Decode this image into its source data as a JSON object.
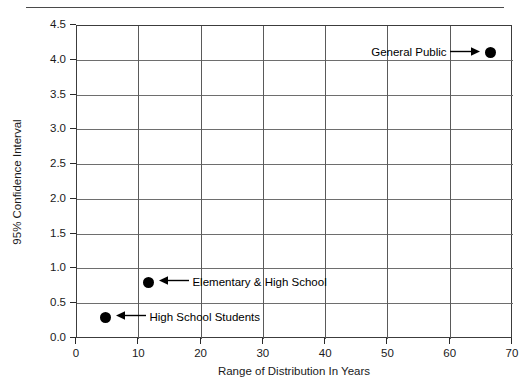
{
  "page": {
    "top_rule_visible": true,
    "top_cropped_text": ""
  },
  "chart_data": {
    "type": "scatter",
    "title": "",
    "xlabel": "Range of Distribution In Years",
    "ylabel": "95% Confidence Interval",
    "xlim": [
      0,
      70
    ],
    "ylim": [
      0.0,
      4.5
    ],
    "xticks": [
      "0",
      "10",
      "20",
      "30",
      "40",
      "50",
      "60",
      "70"
    ],
    "xtick_values": [
      0,
      10,
      20,
      30,
      40,
      50,
      60,
      70
    ],
    "yticks": [
      "0.0",
      "0.5",
      "1.0",
      "1.5",
      "2.0",
      "2.5",
      "3.0",
      "3.5",
      "4.0",
      "4.5"
    ],
    "ytick_values": [
      0.0,
      0.5,
      1.0,
      1.5,
      2.0,
      2.5,
      3.0,
      3.5,
      4.0,
      4.5
    ],
    "grid": true,
    "grid_axes": "both",
    "legend": "none",
    "marker_color": "#000000",
    "marker_shape": "circle",
    "points": [
      {
        "label": "General Public",
        "x": 66.6,
        "y": 4.1,
        "annotation_side": "left",
        "arrow": "→"
      },
      {
        "label": "Elementary & High School",
        "x": 11.6,
        "y": 0.8,
        "annotation_side": "right",
        "arrow": "←"
      },
      {
        "label": "High School Students",
        "x": 4.7,
        "y": 0.3,
        "annotation_side": "right",
        "arrow": "←"
      }
    ]
  }
}
